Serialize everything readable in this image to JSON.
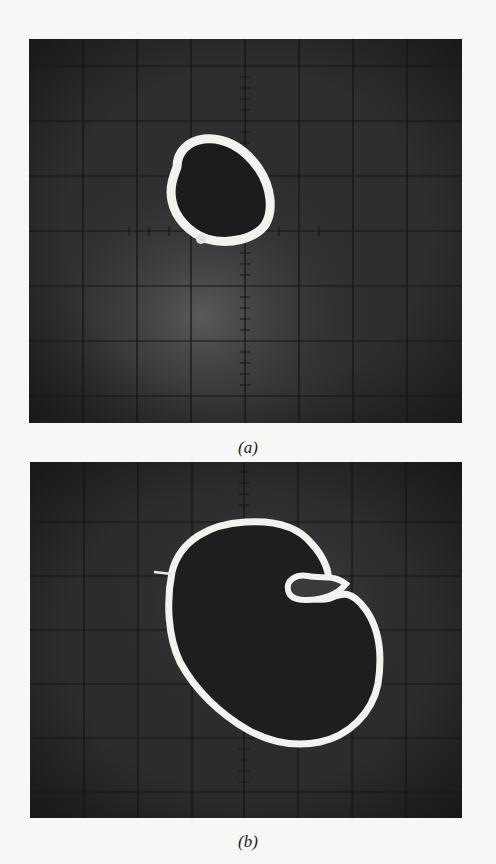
{
  "figure": {
    "panels": [
      {
        "id": "a",
        "caption": "(a)",
        "description": "Oscilloscope screen photograph showing a small closed elliptical loop trace slightly left of and above center, on an 8x7 graticule with a tick-marked center vertical axis.",
        "grid": {
          "columns": 8,
          "rows": 7
        },
        "trace_shape": "small tilted ellipse loop"
      },
      {
        "id": "b",
        "caption": "(b)",
        "description": "Oscilloscope screen photograph showing a larger kidney-shaped closed loop trace with a small inner loop near the upper-right, on an 8x7 graticule with a tick-marked center vertical axis.",
        "grid": {
          "columns": 8,
          "rows": 7
        },
        "trace_shape": "large kidney-shaped loop with small inner loop"
      }
    ],
    "colors": {
      "background": "#f7f7f5",
      "screen": "#2a2a2a",
      "grid": "#141414",
      "trace": "#f2f2ee"
    }
  }
}
